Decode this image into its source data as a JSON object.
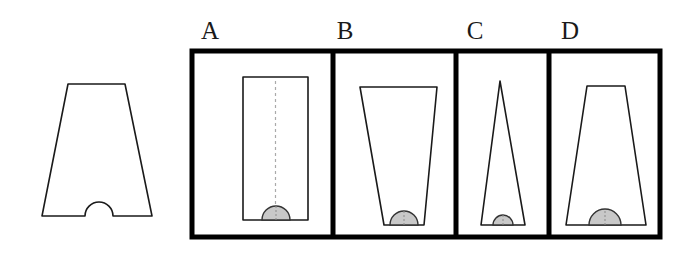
{
  "figure": {
    "type": "spatial-reasoning-multiple-choice",
    "background_color": "#ffffff",
    "outline_color": "#1a1a1a",
    "fill_color": "#ffffff",
    "dome_fill_color": "#c8c8c8",
    "dome_stroke_color": "#333333",
    "dashed_line_color": "#aaaaaa",
    "frame_stroke_color": "#000000",
    "frame_stroke_width": 5
  },
  "prompt_shape": {
    "name": "reference-trapezoid-with-notch",
    "description": "trapezoid narrow at top wide at bottom with semicircular notch cut into bottom center",
    "top_left_x": 68,
    "top_right_x": 125,
    "top_y": 84,
    "bottom_left_x": 42,
    "bottom_right_x": 152,
    "bottom_y": 216,
    "notch_center_x": 99,
    "notch_radius": 14
  },
  "frame": {
    "x": 192,
    "y": 51,
    "width": 468,
    "height": 186,
    "dividers": [
      333,
      456,
      549
    ]
  },
  "options": [
    {
      "id": "A",
      "label": "A",
      "label_x": 210,
      "label_y": 18,
      "shape": "rectangle",
      "description": "upright rectangle with dashed vertical center line and gray semicircular dome on bottom edge",
      "has_dashed_centerline": true,
      "has_dome": true,
      "top_left_x": 243,
      "top_right_x": 308,
      "top_y": 77,
      "bottom_left_x": 243,
      "bottom_right_x": 308,
      "bottom_y": 220,
      "dome_center_x": 276,
      "dome_radius": 14
    },
    {
      "id": "B",
      "label": "B",
      "label_x": 345,
      "label_y": 18,
      "shape": "inverted-trapezoid",
      "description": "trapezoid wide at top narrow at bottom with gray semicircular dome on bottom edge",
      "has_dashed_centerline": false,
      "has_dome": true,
      "top_left_x": 360,
      "top_right_x": 437,
      "top_y": 87,
      "bottom_left_x": 384,
      "bottom_right_x": 424,
      "bottom_y": 225,
      "dome_center_x": 404,
      "dome_radius": 14
    },
    {
      "id": "C",
      "label": "C",
      "label_x": 475,
      "label_y": 18,
      "shape": "narrow-triangle",
      "description": "tall narrow isosceles triangle with small gray semicircular dome on bottom edge",
      "has_dashed_centerline": false,
      "has_dome": true,
      "apex_x": 500,
      "apex_y": 81,
      "bottom_left_x": 481,
      "bottom_right_x": 525,
      "bottom_y": 225,
      "dome_center_x": 503,
      "dome_radius": 10
    },
    {
      "id": "D",
      "label": "D",
      "label_x": 570,
      "label_y": 18,
      "shape": "trapezoid",
      "description": "trapezoid narrow at top wide at bottom with gray semicircular dome on bottom edge matching the reference shape",
      "has_dashed_centerline": false,
      "has_dome": true,
      "top_left_x": 587,
      "top_right_x": 625,
      "top_y": 86,
      "bottom_left_x": 566,
      "bottom_right_x": 646,
      "bottom_y": 225,
      "dome_center_x": 605,
      "dome_radius": 16
    }
  ]
}
